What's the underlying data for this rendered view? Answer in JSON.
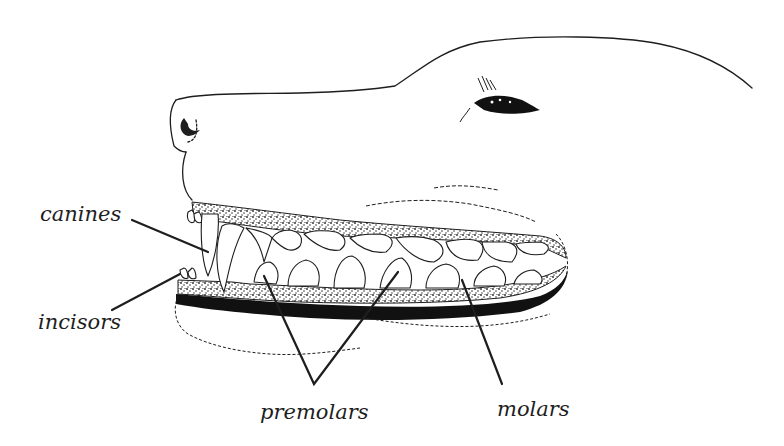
{
  "diagram": {
    "labels": {
      "canines": "canines",
      "incisors": "incisors",
      "premolars": "premolars",
      "molars": "molars"
    },
    "colors": {
      "ink": "#1e1e1e",
      "background": "#ffffff",
      "gum_stipple": "#6a6a6a"
    }
  }
}
